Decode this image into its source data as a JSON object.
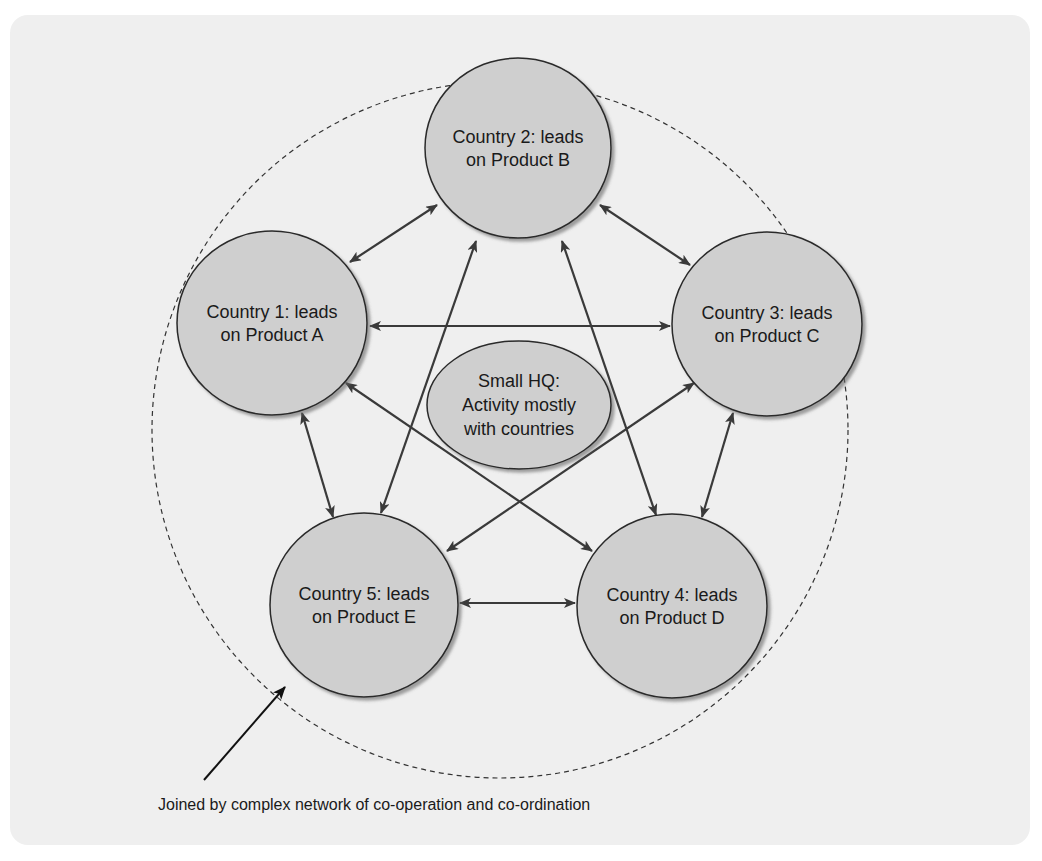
{
  "diagram": {
    "type": "network",
    "boundary": {
      "label": "Joined by complex network of co-operation and co-ordination",
      "style": "dashed circle"
    },
    "center_node": {
      "id": "hq",
      "lines": [
        "Small HQ:",
        "Activity mostly",
        "with countries"
      ]
    },
    "nodes": [
      {
        "id": "c1",
        "lines": [
          "Country 1: leads",
          "on Product A"
        ]
      },
      {
        "id": "c2",
        "lines": [
          "Country 2: leads",
          "on Product B"
        ]
      },
      {
        "id": "c3",
        "lines": [
          "Country 3: leads",
          "on Product C"
        ]
      },
      {
        "id": "c4",
        "lines": [
          "Country 4: leads",
          "on Product D"
        ]
      },
      {
        "id": "c5",
        "lines": [
          "Country 5: leads",
          "on Product E"
        ]
      }
    ],
    "edges": [
      {
        "from": "c1",
        "to": "c2",
        "bidirectional": true
      },
      {
        "from": "c2",
        "to": "c3",
        "bidirectional": true
      },
      {
        "from": "c1",
        "to": "c3",
        "bidirectional": true
      },
      {
        "from": "c1",
        "to": "c5",
        "bidirectional": true
      },
      {
        "from": "c3",
        "to": "c4",
        "bidirectional": true
      },
      {
        "from": "c5",
        "to": "c4",
        "bidirectional": true
      },
      {
        "from": "c2",
        "to": "c5",
        "bidirectional": true
      },
      {
        "from": "c2",
        "to": "c4",
        "bidirectional": true
      },
      {
        "from": "c1",
        "to": "c4",
        "bidirectional": true
      },
      {
        "from": "c3",
        "to": "c5",
        "bidirectional": true
      }
    ],
    "colors": {
      "panel": "#efefef",
      "node_fill": "#cfcfcf",
      "node_stroke": "#2a2a2a",
      "edge": "#3a3a3a",
      "text": "#1a1a1a"
    }
  }
}
